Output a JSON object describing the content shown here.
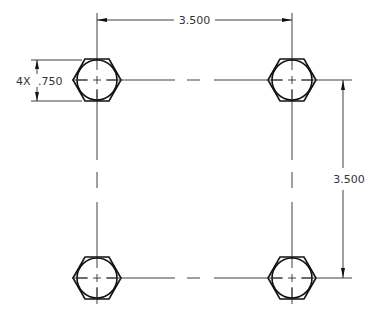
{
  "drawing": {
    "type": "technical-drawing",
    "description": "Four hex bolts on a square bolt pattern with dimensions",
    "colors": {
      "line": "#111111",
      "background": "#ffffff",
      "text": "#333333"
    },
    "dimensions": {
      "horizontal_spacing": {
        "label": "3.500"
      },
      "vertical_spacing": {
        "label": "3.500"
      },
      "diameter": {
        "qty": "4X",
        "value": ".750"
      }
    },
    "bolts": [
      {
        "id": "top-left"
      },
      {
        "id": "top-right"
      },
      {
        "id": "bottom-left"
      },
      {
        "id": "bottom-right"
      }
    ]
  }
}
